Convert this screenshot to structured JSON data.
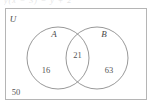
{
  "figure": {
    "type": "venn-diagram",
    "universe_label": "U",
    "set_labels": {
      "left": "A",
      "right": "B"
    },
    "regions": [
      {
        "name": "A only",
        "label": "16"
      },
      {
        "name": "A and B",
        "label": "21"
      },
      {
        "name": "B only",
        "label": "63"
      },
      {
        "name": "outside A and B",
        "label": "50"
      }
    ],
    "region_values": {
      "a_only": "16",
      "intersection": "21",
      "b_only": "63",
      "outside": "50"
    },
    "colors": {
      "stroke": "#8c8c8c",
      "border": "#b5b5b5",
      "text": "#4a4a4a",
      "background": "#ffffff"
    },
    "top_cropped_text": "y(x − 3) = y + 2"
  }
}
